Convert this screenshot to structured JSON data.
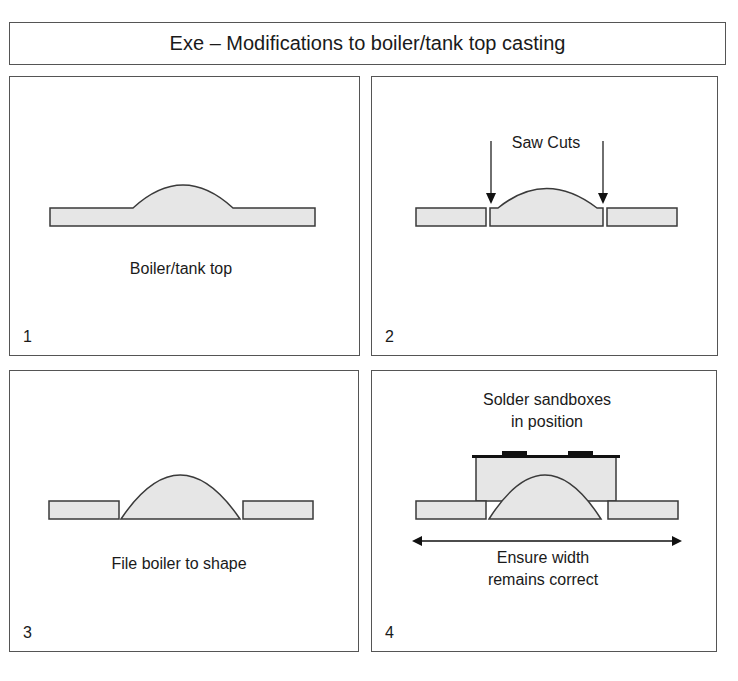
{
  "title": "Exe – Modifications to boiler/tank top casting",
  "colors": {
    "fill": "#e6e6e6",
    "stroke": "#3a3a3a",
    "border": "#555555"
  },
  "panels": [
    {
      "number": "1",
      "caption": "Boiler/tank top"
    },
    {
      "number": "2",
      "caption": "Saw Cuts"
    },
    {
      "number": "3",
      "caption": "File boiler to shape"
    },
    {
      "number": "4",
      "caption_top_line1": "Solder sandboxes",
      "caption_top_line2": "in position",
      "caption_bottom_line1": "Ensure width",
      "caption_bottom_line2": "remains correct"
    }
  ]
}
